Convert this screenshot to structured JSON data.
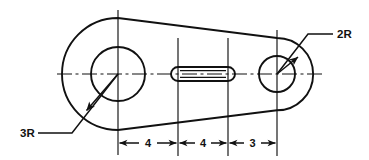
{
  "drawing": {
    "title": "Mechanical part orthographic sketch",
    "type": "engineering-drawing",
    "canvas": {
      "width": 369,
      "height": 160,
      "background": "#ffffff"
    },
    "line_color": "#111111",
    "radius_callouts": [
      {
        "id": "left-radius",
        "label": "3R",
        "text_x": 20,
        "text_y": 137,
        "leader": [
          [
            38,
            133
          ],
          [
            72,
            133
          ],
          [
            118,
            74
          ]
        ],
        "arrow_at": [
          88,
          109
        ],
        "arrow_angle_deg": 232
      },
      {
        "id": "right-radius",
        "label": "2R",
        "text_x": 337,
        "text_y": 38,
        "leader": [
          [
            333,
            34
          ],
          [
            308,
            34
          ],
          [
            277,
            74
          ]
        ],
        "arrow_at": [
          296,
          60
        ],
        "arrow_angle_deg": 128
      }
    ],
    "dimensions": {
      "line_y": 143,
      "extension_lines": [
        {
          "x": 118,
          "y_top": 120,
          "y_bottom": 156
        },
        {
          "x": 178,
          "y_top": 120,
          "y_bottom": 156
        },
        {
          "x": 228,
          "y_top": 120,
          "y_bottom": 156
        },
        {
          "x": 277,
          "y_top": 120,
          "y_bottom": 156
        }
      ],
      "segments": [
        {
          "label": "4",
          "x1": 118,
          "x2": 178,
          "text_x": 148,
          "text_y": 147
        },
        {
          "label": "4",
          "x1": 178,
          "x2": 228,
          "text_x": 203,
          "text_y": 147
        },
        {
          "label": "3",
          "x1": 228,
          "x2": 277,
          "text_x": 252.5,
          "text_y": 147
        }
      ]
    },
    "features": {
      "left_boss": {
        "center_x": 118,
        "center_y": 74,
        "hole_radius": 27,
        "outer_radius": 56
      },
      "right_boss": {
        "center_x": 277,
        "center_y": 74,
        "hole_radius": 18,
        "outer_radius": 36
      },
      "slot": {
        "x1": 178,
        "x2": 228,
        "center_y": 74,
        "half_height": 7
      }
    },
    "centerlines": {
      "horizontal": {
        "x1": 57,
        "x2": 322,
        "y": 74
      },
      "verticals": [
        {
          "x": 118,
          "y1": 10,
          "y2": 155
        },
        {
          "x": 178,
          "y1": 38,
          "y2": 156
        },
        {
          "x": 228,
          "y1": 38,
          "y2": 156
        },
        {
          "x": 277,
          "y1": 30,
          "y2": 156
        }
      ]
    }
  }
}
